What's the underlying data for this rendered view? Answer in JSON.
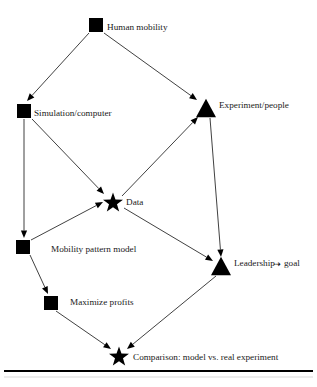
{
  "figure": {
    "background_color": "#ffffff",
    "ink_color": "#000000",
    "edge_color": "#2b2b2b"
  },
  "nodes": [
    {
      "id": "human-mobility",
      "label": "Human mobility",
      "shape": "square",
      "x": 96,
      "y": 25,
      "size": 14,
      "label_x": 107,
      "label_y": 28,
      "label_anchor": "start"
    },
    {
      "id": "simulation-computer",
      "label": "Simulation/computer",
      "shape": "square",
      "x": 24,
      "y": 111,
      "size": 14,
      "label_x": 34,
      "label_y": 114,
      "label_anchor": "start"
    },
    {
      "id": "experiment-people",
      "label": "Experiment/people",
      "shape": "triangle",
      "x": 206,
      "y": 108,
      "size": 20,
      "label_x": 219,
      "label_y": 106,
      "label_anchor": "start"
    },
    {
      "id": "data",
      "label": "Data",
      "shape": "star",
      "x": 113,
      "y": 203,
      "size": 21,
      "label_x": 126,
      "label_y": 203,
      "label_anchor": "start"
    },
    {
      "id": "mobility-pattern-model",
      "label": "Mobility pattern model",
      "shape": "square",
      "x": 23,
      "y": 247,
      "size": 14,
      "label_x": 51,
      "label_y": 250,
      "label_anchor": "start"
    },
    {
      "id": "leadership",
      "label": "Leadership",
      "shape": "triangle",
      "x": 221,
      "y": 266,
      "size": 20,
      "label_x": 234,
      "label_y": 264,
      "label_anchor": "start"
    },
    {
      "id": "maximize-profits",
      "label": "Maximize profits",
      "shape": "square",
      "x": 51,
      "y": 303,
      "size": 14,
      "label_x": 70,
      "label_y": 303,
      "label_anchor": "start"
    },
    {
      "id": "comparison",
      "label": "Comparison: model vs. real experiment",
      "shape": "star",
      "x": 119,
      "y": 357,
      "size": 21,
      "label_x": 133,
      "label_y": 358,
      "label_anchor": "start"
    }
  ],
  "goal_annotation": {
    "arrow_glyph": "⇢",
    "arrow_x": 273,
    "arrow_y": 264,
    "label": "goal",
    "label_x": 284,
    "label_y": 264
  },
  "edges": [
    {
      "id": "human-mobility-to-simulation",
      "from": "human-mobility",
      "to": "simulation-computer",
      "x1": 89,
      "y1": 33,
      "x2": 27,
      "y2": 101,
      "arrow": true
    },
    {
      "id": "human-mobility-to-experiment",
      "from": "human-mobility",
      "to": "experiment-people",
      "x1": 104,
      "y1": 33,
      "x2": 197,
      "y2": 100,
      "arrow": true
    },
    {
      "id": "simulation-to-mobility-pattern-model",
      "from": "simulation-computer",
      "to": "mobility-pattern-model",
      "x1": 24,
      "y1": 119,
      "x2": 24,
      "y2": 238,
      "arrow": true
    },
    {
      "id": "simulation-to-data",
      "from": "simulation-computer",
      "to": "data",
      "x1": 32,
      "y1": 119,
      "x2": 104,
      "y2": 194,
      "arrow": true
    },
    {
      "id": "mobility-pattern-model-to-data",
      "from": "mobility-pattern-model",
      "to": "data",
      "x1": 31,
      "y1": 240,
      "x2": 103,
      "y2": 202,
      "arrow": true
    },
    {
      "id": "data-to-experiment",
      "from": "data",
      "to": "experiment-people",
      "x1": 122,
      "y1": 196,
      "x2": 198,
      "y2": 117,
      "arrow": true
    },
    {
      "id": "experiment-to-leadership",
      "from": "experiment-people",
      "to": "leadership",
      "x1": 210,
      "y1": 118,
      "x2": 221,
      "y2": 257,
      "arrow": true
    },
    {
      "id": "data-to-leadership",
      "from": "data",
      "to": "leadership",
      "x1": 124,
      "y1": 208,
      "x2": 213,
      "y2": 261,
      "arrow": true
    },
    {
      "id": "mobility-pattern-model-to-maximize",
      "from": "mobility-pattern-model",
      "to": "maximize-profits",
      "x1": 30,
      "y1": 255,
      "x2": 48,
      "y2": 294,
      "arrow": true
    },
    {
      "id": "maximize-to-comparison",
      "from": "maximize-profits",
      "to": "comparison",
      "x1": 56,
      "y1": 311,
      "x2": 111,
      "y2": 349,
      "arrow": true
    },
    {
      "id": "leadership-to-comparison",
      "from": "leadership",
      "to": "comparison",
      "x1": 216,
      "y1": 276,
      "x2": 127,
      "y2": 349,
      "arrow": true
    }
  ],
  "rules": [
    {
      "id": "caption-rule-thick",
      "x1": 4,
      "y1": 371,
      "x2": 313,
      "y2": 371,
      "weight": "thick"
    },
    {
      "id": "caption-rule-thin",
      "x1": 4,
      "y1": 377,
      "x2": 313,
      "y2": 377,
      "weight": "thin"
    }
  ]
}
